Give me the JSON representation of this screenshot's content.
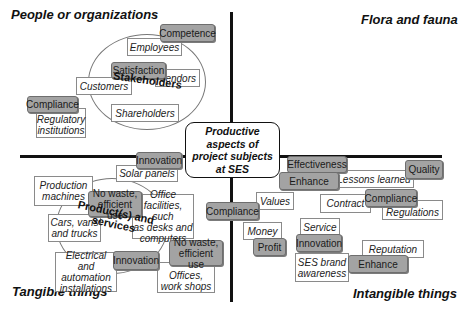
{
  "diagram": {
    "center": {
      "label": "Productive\naspects of\nproject subjects\nat SES"
    },
    "quadrants": {
      "top_left": {
        "title": "People or organizations",
        "group_label": "Stakeholders",
        "items": [
          {
            "id": "competence",
            "label": "Competence",
            "kind": "aspect"
          },
          {
            "id": "employees",
            "label": "Employees",
            "kind": "subject"
          },
          {
            "id": "satisfaction",
            "label": "Satisfaction",
            "kind": "aspect"
          },
          {
            "id": "vendors",
            "label": "Vendors",
            "kind": "subject"
          },
          {
            "id": "customers",
            "label": "Customers",
            "kind": "subject"
          },
          {
            "id": "shareholders",
            "label": "Shareholders",
            "kind": "subject"
          },
          {
            "id": "compliance",
            "label": "Compliance",
            "kind": "aspect"
          },
          {
            "id": "regulatory",
            "label": "Regulatory\ninstitutions",
            "kind": "subject"
          }
        ]
      },
      "top_right": {
        "title": "Flora and fauna",
        "items": []
      },
      "bottom_left": {
        "title": "Tangible things",
        "group_label": "Product(s) and\nservices",
        "items": [
          {
            "id": "innovation1",
            "label": "Innovation",
            "kind": "aspect"
          },
          {
            "id": "solar",
            "label": "Solar panels",
            "kind": "subject"
          },
          {
            "id": "production",
            "label": "Production\nmachines",
            "kind": "subject"
          },
          {
            "id": "nowaste1",
            "label": "No waste,\nefficient use",
            "kind": "aspect"
          },
          {
            "id": "office",
            "label": "Office\nfacilities, such\nas desks and\ncomputers",
            "kind": "subject"
          },
          {
            "id": "cars",
            "label": "Cars, vans\nand trucks",
            "kind": "subject"
          },
          {
            "id": "electrical",
            "label": "Electrical and\nautomation\ninstallations",
            "kind": "subject"
          },
          {
            "id": "innovation2",
            "label": "Innovation",
            "kind": "aspect"
          },
          {
            "id": "nowaste2",
            "label": "No waste,\nefficient use",
            "kind": "aspect"
          },
          {
            "id": "offices",
            "label": "Offices,\nwork shops",
            "kind": "subject"
          }
        ]
      },
      "bottom_right": {
        "title": "Intangible things",
        "items": [
          {
            "id": "effectiveness",
            "label": "Effectiveness",
            "kind": "aspect"
          },
          {
            "id": "enhance1",
            "label": "Enhance",
            "kind": "aspect"
          },
          {
            "id": "lessons",
            "label": "Lessons learned",
            "kind": "subject"
          },
          {
            "id": "quality",
            "label": "Quality",
            "kind": "aspect"
          },
          {
            "id": "values",
            "label": "Values",
            "kind": "subject"
          },
          {
            "id": "contract",
            "label": "Contract",
            "kind": "subject"
          },
          {
            "id": "compliance2",
            "label": "Compliance",
            "kind": "aspect"
          },
          {
            "id": "regulations",
            "label": "Regulations",
            "kind": "subject"
          },
          {
            "id": "compliance3",
            "label": "Compliance",
            "kind": "aspect"
          },
          {
            "id": "money",
            "label": "Money",
            "kind": "subject"
          },
          {
            "id": "service",
            "label": "Service",
            "kind": "subject"
          },
          {
            "id": "profit",
            "label": "Profit",
            "kind": "aspect"
          },
          {
            "id": "innovation3",
            "label": "Innovation",
            "kind": "aspect"
          },
          {
            "id": "reputation",
            "label": "Reputation",
            "kind": "subject"
          },
          {
            "id": "brand",
            "label": "SES brand\nawareness",
            "kind": "subject"
          },
          {
            "id": "enhance2",
            "label": "Enhance",
            "kind": "aspect"
          }
        ]
      }
    },
    "colors": {
      "aspect_fill": "#a3a3a3",
      "subject_fill": "#ffffff",
      "axis": "#111111"
    }
  }
}
